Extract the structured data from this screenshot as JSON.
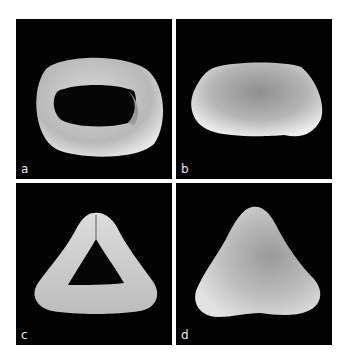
{
  "figure": {
    "panels": [
      {
        "id": "a",
        "label": "a",
        "subject": "ellipsoidal grain with open aperture (SEM)"
      },
      {
        "id": "b",
        "label": "b",
        "subject": "elongated oblong grain, closed (SEM)"
      },
      {
        "id": "c",
        "label": "c",
        "subject": "triangular grain with open central aperture (SEM)"
      },
      {
        "id": "d",
        "label": "d",
        "subject": "triangular grain, closed (SEM)"
      }
    ],
    "colors": {
      "background": "#ffffff",
      "panel_background": "#020202",
      "specimen_light": "#e6e6e6",
      "specimen_mid": "#a9a9a9",
      "label": "#e8e8e8"
    }
  }
}
